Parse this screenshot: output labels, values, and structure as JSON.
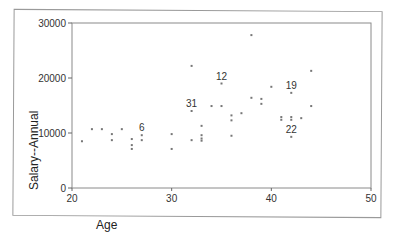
{
  "chart_data": {
    "type": "scatter",
    "title": "",
    "xlabel": "Age",
    "ylabel": "Salary--Annual",
    "xlim": [
      20,
      50
    ],
    "ylim": [
      0,
      30000
    ],
    "x_ticks": [
      20,
      30,
      40,
      50
    ],
    "y_ticks": [
      0,
      10000,
      20000,
      30000
    ],
    "grid": false,
    "legend": null,
    "points": [
      {
        "x": 21,
        "y": 8500
      },
      {
        "x": 22,
        "y": 10700
      },
      {
        "x": 23,
        "y": 10700
      },
      {
        "x": 24,
        "y": 9800
      },
      {
        "x": 24,
        "y": 8700
      },
      {
        "x": 25,
        "y": 10700
      },
      {
        "x": 26,
        "y": 8900
      },
      {
        "x": 26,
        "y": 7800
      },
      {
        "x": 26,
        "y": 7100
      },
      {
        "x": 27,
        "y": 9600,
        "label": "6"
      },
      {
        "x": 27,
        "y": 8700
      },
      {
        "x": 30,
        "y": 9800
      },
      {
        "x": 30,
        "y": 7100
      },
      {
        "x": 32,
        "y": 8700
      },
      {
        "x": 32,
        "y": 14000,
        "label": "31"
      },
      {
        "x": 32,
        "y": 22200
      },
      {
        "x": 33,
        "y": 11300
      },
      {
        "x": 33,
        "y": 9600
      },
      {
        "x": 33,
        "y": 9000
      },
      {
        "x": 33,
        "y": 8600
      },
      {
        "x": 34,
        "y": 14900
      },
      {
        "x": 35,
        "y": 14900
      },
      {
        "x": 35,
        "y": 19000,
        "label": "12"
      },
      {
        "x": 36,
        "y": 13200
      },
      {
        "x": 36,
        "y": 12300
      },
      {
        "x": 36,
        "y": 9500
      },
      {
        "x": 37,
        "y": 13600
      },
      {
        "x": 38,
        "y": 16400
      },
      {
        "x": 38,
        "y": 27800
      },
      {
        "x": 39,
        "y": 16200
      },
      {
        "x": 39,
        "y": 15300
      },
      {
        "x": 40,
        "y": 18400
      },
      {
        "x": 41,
        "y": 12900
      },
      {
        "x": 41,
        "y": 12400
      },
      {
        "x": 42,
        "y": 12900
      },
      {
        "x": 42,
        "y": 12400
      },
      {
        "x": 42,
        "y": 9300,
        "label": "22"
      },
      {
        "x": 42,
        "y": 17300,
        "label": "19"
      },
      {
        "x": 43,
        "y": 12700
      },
      {
        "x": 44,
        "y": 21300
      },
      {
        "x": 44,
        "y": 14900
      }
    ]
  },
  "labels": {
    "x_title": "Age",
    "y_title": "Salary--Annual",
    "x_ticks": [
      "20",
      "30",
      "40",
      "50"
    ],
    "y_ticks": [
      "0",
      "10000",
      "20000",
      "30000"
    ]
  },
  "colors": {
    "point": "#777777",
    "axis": "#888888",
    "frame": "#9a9a9a"
  }
}
